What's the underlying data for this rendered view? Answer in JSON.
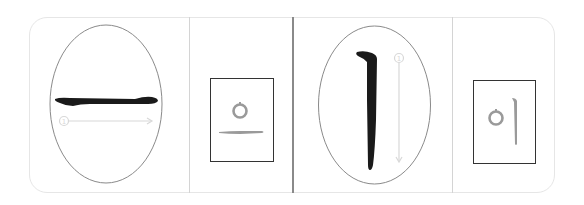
{
  "worksheet": {
    "title": "Korean vowel stroke order practice",
    "lessons": [
      {
        "vowel": "ㅡ",
        "stroke_direction": "left-to-right",
        "stroke_number_label": "①",
        "example_syllable": "으",
        "example_parts": [
          "ㅇ",
          "ㅡ"
        ]
      },
      {
        "vowel": "ㅣ",
        "stroke_direction": "top-to-bottom",
        "stroke_number_label": "①",
        "example_syllable": "이",
        "example_parts": [
          "ㅇ",
          "ㅣ"
        ]
      }
    ]
  },
  "colors": {
    "stroke_ink": "#1a1a1a",
    "guide": "#d8d8d8",
    "example_ink": "#9a9a9a",
    "ellipse": "#8a8a8a",
    "box": "#333333",
    "frame": "#e6e6e6"
  }
}
